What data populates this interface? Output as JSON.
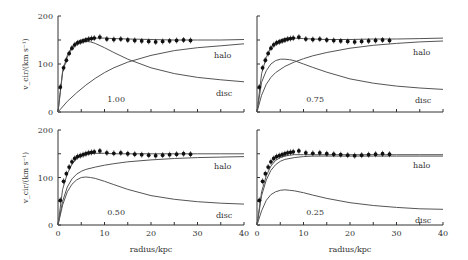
{
  "chart_data": {
    "type": "line",
    "xlabel": "radius/kpc",
    "ylabel": "v_cir/(km s⁻¹)",
    "xlim": [
      0,
      40
    ],
    "ylim": [
      0,
      200
    ],
    "xticks": [
      0,
      10,
      20,
      30,
      40
    ],
    "yticks": [
      0,
      100,
      200
    ],
    "observed": {
      "name": "observed",
      "x": [
        0.5,
        1.2,
        1.8,
        2.4,
        3.0,
        3.6,
        4.2,
        4.8,
        5.4,
        6.0,
        6.6,
        7.2,
        7.8,
        9.0,
        10.5,
        12.0,
        13.5,
        15.0,
        16.5,
        18.0,
        19.5,
        21.0,
        22.5,
        24.0,
        25.5,
        27.0,
        28.5
      ],
      "y": [
        52,
        92,
        108,
        122,
        133,
        140,
        144,
        146,
        148,
        150,
        152,
        153,
        154,
        156,
        152,
        151,
        152,
        150,
        149,
        148,
        147,
        146,
        147,
        148,
        149,
        150,
        149
      ]
    },
    "panels": [
      {
        "label": "1.00",
        "total": {
          "x": [
            0,
            1,
            2,
            3,
            4,
            5,
            6,
            7,
            8,
            10,
            12,
            15,
            20,
            25,
            30,
            35,
            40
          ],
          "y": [
            0,
            85,
            118,
            136,
            146,
            150,
            152,
            153,
            154,
            154,
            153,
            152,
            151,
            150,
            150,
            150,
            151
          ]
        },
        "halo": {
          "x": [
            0,
            2,
            4,
            6,
            8,
            10,
            12,
            15,
            20,
            25,
            30,
            35,
            40
          ],
          "y": [
            0,
            22,
            40,
            56,
            70,
            82,
            92,
            104,
            118,
            128,
            134,
            138,
            142
          ]
        },
        "disc": {
          "x": [
            0,
            1,
            2,
            3,
            4,
            5,
            6,
            7,
            8,
            10,
            12,
            15,
            20,
            25,
            30,
            35,
            40
          ],
          "y": [
            0,
            82,
            115,
            133,
            142,
            146,
            147,
            146,
            143,
            134,
            124,
            110,
            92,
            80,
            72,
            67,
            63
          ]
        },
        "halo_label": "halo",
        "disc_label": "disc"
      },
      {
        "label": "0.75",
        "total": {
          "x": [
            0,
            1,
            2,
            3,
            4,
            5,
            6,
            7,
            8,
            10,
            12,
            15,
            20,
            25,
            30,
            35,
            40
          ],
          "y": [
            0,
            80,
            114,
            134,
            145,
            150,
            153,
            154,
            154,
            153,
            152,
            151,
            151,
            152,
            152,
            153,
            154
          ]
        },
        "halo": {
          "x": [
            0,
            1,
            2,
            3,
            4,
            6,
            8,
            10,
            12,
            15,
            20,
            25,
            30,
            35,
            40
          ],
          "y": [
            0,
            35,
            58,
            72,
            82,
            95,
            104,
            111,
            117,
            124,
            133,
            139,
            143,
            146,
            148
          ]
        },
        "disc": {
          "x": [
            0,
            1,
            2,
            3,
            4,
            5,
            6,
            7,
            8,
            10,
            12,
            15,
            20,
            25,
            30,
            35,
            40
          ],
          "y": [
            0,
            62,
            86,
            100,
            107,
            110,
            110,
            109,
            107,
            100,
            93,
            83,
            69,
            60,
            54,
            50,
            47
          ]
        },
        "halo_label": "halo",
        "disc_label": "disc"
      },
      {
        "label": "0.50",
        "total": {
          "x": [
            0,
            1,
            2,
            3,
            4,
            5,
            6,
            7,
            8,
            10,
            12,
            15,
            20,
            25,
            30,
            35,
            40
          ],
          "y": [
            0,
            75,
            108,
            128,
            140,
            146,
            149,
            150,
            151,
            151,
            150,
            150,
            150,
            150,
            150,
            150,
            150
          ]
        },
        "halo": {
          "x": [
            0,
            1,
            2,
            3,
            4,
            5,
            6,
            8,
            10,
            12,
            15,
            20,
            25,
            30,
            35,
            40
          ],
          "y": [
            0,
            50,
            80,
            97,
            107,
            113,
            117,
            122,
            126,
            129,
            133,
            137,
            140,
            142,
            143,
            144
          ]
        },
        "disc": {
          "x": [
            0,
            1,
            2,
            3,
            4,
            5,
            6,
            7,
            8,
            10,
            12,
            15,
            20,
            25,
            30,
            35,
            40
          ],
          "y": [
            0,
            42,
            70,
            86,
            95,
            100,
            101,
            100,
            98,
            92,
            85,
            75,
            62,
            54,
            49,
            46,
            44
          ]
        },
        "halo_label": "halo",
        "disc_label": "disc"
      },
      {
        "label": "0.25",
        "total": {
          "x": [
            0,
            1,
            2,
            3,
            4,
            5,
            6,
            7,
            8,
            10,
            12,
            15,
            20,
            25,
            30,
            35,
            40
          ],
          "y": [
            0,
            70,
            104,
            124,
            136,
            142,
            145,
            147,
            148,
            148,
            148,
            148,
            148,
            148,
            148,
            148,
            148
          ]
        },
        "halo": {
          "x": [
            0,
            1,
            2,
            3,
            4,
            5,
            6,
            8,
            10,
            12,
            15,
            20,
            25,
            30,
            35,
            40
          ],
          "y": [
            0,
            62,
            95,
            115,
            127,
            134,
            138,
            142,
            144,
            145,
            145,
            145,
            145,
            145,
            145,
            145
          ]
        },
        "disc": {
          "x": [
            0,
            1,
            2,
            3,
            4,
            5,
            6,
            7,
            8,
            10,
            12,
            15,
            20,
            25,
            30,
            35,
            40
          ],
          "y": [
            0,
            30,
            52,
            64,
            70,
            73,
            74,
            73,
            72,
            68,
            63,
            56,
            47,
            41,
            37,
            34,
            33
          ]
        },
        "halo_label": "halo",
        "disc_label": "disc"
      }
    ]
  }
}
